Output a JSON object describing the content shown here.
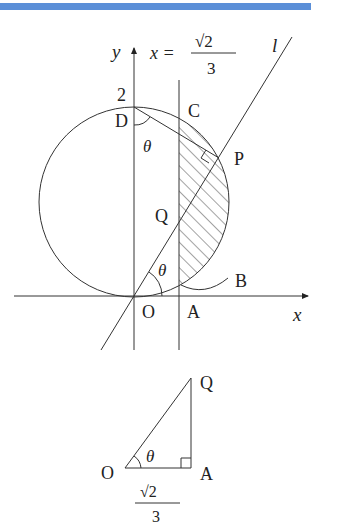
{
  "header_bar": {
    "color": "#5b8fd8"
  },
  "figure1": {
    "axis_labels": {
      "x": "x",
      "y": "y"
    },
    "line_equation": {
      "lhs": "x =",
      "numerator": "√2",
      "denominator": "3"
    },
    "line_label": "l",
    "y_intercept_label": "2",
    "points": {
      "D": "D",
      "C": "C",
      "P": "P",
      "Q": "Q",
      "O": "O",
      "A": "A",
      "B": "B"
    },
    "angles": {
      "at_D": "θ",
      "at_O": "θ"
    },
    "shaded_region": "hatched region bounded by x=√2/3 and circle arc"
  },
  "figure2": {
    "points": {
      "O": "O",
      "A": "A",
      "Q": "Q"
    },
    "angle": "θ",
    "base_length": {
      "numerator": "√2",
      "denominator": "3"
    }
  },
  "colors": {
    "stroke": "#333333",
    "text": "#222222"
  }
}
